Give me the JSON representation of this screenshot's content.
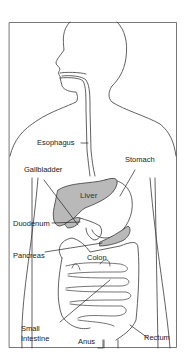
{
  "diagram": {
    "colors": {
      "line": "#3a3a3a",
      "organ_fill": "#b9b9b9",
      "background": "#ffffff"
    },
    "labels": {
      "esophagus": "Esophagus",
      "stomach": "Stomach",
      "gallbladder": "Gallbladder",
      "liver": "Liver",
      "duodenum": "Duodenum",
      "pancreas": "Pancreas",
      "colon": "Colon",
      "small_intestine_1": "Small",
      "small_intestine_2": "Intestine",
      "anus": "Anus",
      "rectum": "Rectum"
    }
  }
}
